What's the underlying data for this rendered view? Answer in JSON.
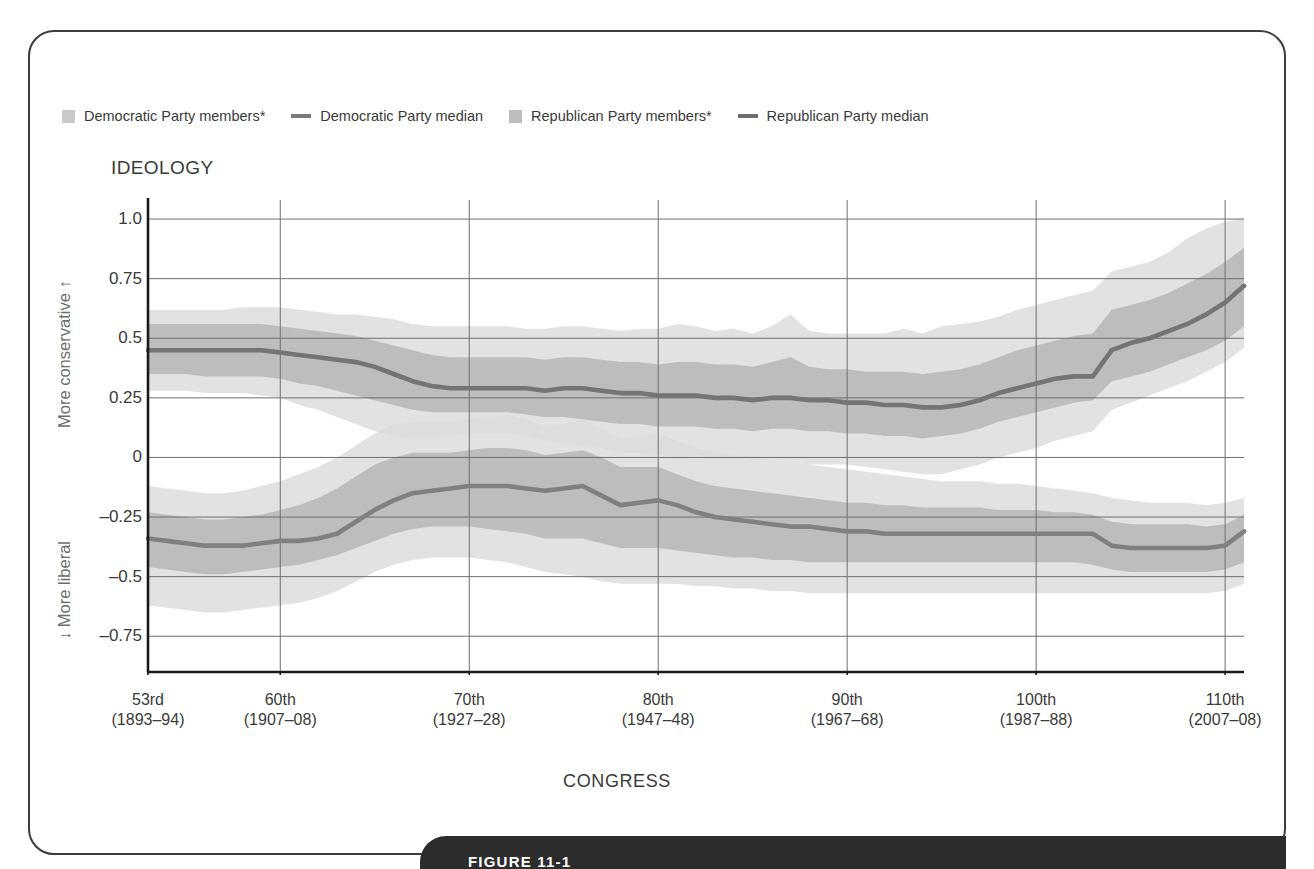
{
  "figure": {
    "caption": "FIGURE 11-1",
    "ideology_title": "IDEOLOGY",
    "congress_title": "CONGRESS",
    "direction_up": "More conservative ↑",
    "direction_down": "↓ More liberal"
  },
  "legend": {
    "items": [
      {
        "label": "Democratic Party members*",
        "marker": "box",
        "color": "#c9c9c9",
        "name": "legend-dem-members"
      },
      {
        "label": "Democratic Party median",
        "marker": "line",
        "color": "#7a7a7a",
        "name": "legend-dem-median"
      },
      {
        "label": "Republican Party members*",
        "marker": "box",
        "color": "#bdbdbd",
        "name": "legend-rep-members"
      },
      {
        "label": "Republican Party median",
        "marker": "line",
        "color": "#6e6e6e",
        "name": "legend-rep-median"
      }
    ]
  },
  "colors": {
    "band_outer": "#dcdcdc",
    "band_mid": "#c6c6c6",
    "band_inner": "#b4b4b4",
    "median_dem": "#808080",
    "median_rep": "#747474",
    "grid": "#6f6f6f",
    "axis": "#1a1a1a",
    "caption_bar": "#2c2c2c",
    "frame": "#3c3c3c"
  },
  "chart_data": {
    "type": "line",
    "title": "IDEOLOGY",
    "xlabel": "CONGRESS",
    "ylabel": "Ideology (DW-NOMINATE first dimension)",
    "grid": true,
    "legend_position": "top-left",
    "ylim": [
      -0.9,
      1.08
    ],
    "xlim": [
      53,
      111
    ],
    "yticks": [
      1.0,
      0.75,
      0.5,
      0.25,
      0,
      -0.25,
      -0.5,
      -0.75
    ],
    "ytick_labels": [
      "1.0",
      "0.75",
      "0.5",
      "0.25",
      "0",
      "–0.25",
      "–0.5",
      "–0.75"
    ],
    "xticks": [
      53,
      60,
      70,
      80,
      90,
      100,
      110
    ],
    "xtick_labels": [
      {
        "congress": "53rd",
        "years": "(1893–94)"
      },
      {
        "congress": "60th",
        "years": "(1907–08)"
      },
      {
        "congress": "70th",
        "years": "(1927–28)"
      },
      {
        "congress": "80th",
        "years": "(1947–48)"
      },
      {
        "congress": "90th",
        "years": "(1967–68)"
      },
      {
        "congress": "100th",
        "years": "(1987–88)"
      },
      {
        "congress": "110th",
        "years": "(2007–08)"
      }
    ],
    "x": [
      53,
      54,
      55,
      56,
      57,
      58,
      59,
      60,
      61,
      62,
      63,
      64,
      65,
      66,
      67,
      68,
      69,
      70,
      71,
      72,
      73,
      74,
      75,
      76,
      77,
      78,
      79,
      80,
      81,
      82,
      83,
      84,
      85,
      86,
      87,
      88,
      89,
      90,
      91,
      92,
      93,
      94,
      95,
      96,
      97,
      98,
      99,
      100,
      101,
      102,
      103,
      104,
      105,
      106,
      107,
      108,
      109,
      110,
      111
    ],
    "series": [
      {
        "name": "Republican Party median",
        "color": "#747474",
        "values": [
          0.45,
          0.45,
          0.45,
          0.45,
          0.45,
          0.45,
          0.45,
          0.44,
          0.43,
          0.42,
          0.41,
          0.4,
          0.38,
          0.35,
          0.32,
          0.3,
          0.29,
          0.29,
          0.29,
          0.29,
          0.29,
          0.28,
          0.29,
          0.29,
          0.28,
          0.27,
          0.27,
          0.26,
          0.26,
          0.26,
          0.25,
          0.25,
          0.24,
          0.25,
          0.25,
          0.24,
          0.24,
          0.23,
          0.23,
          0.22,
          0.22,
          0.21,
          0.21,
          0.22,
          0.24,
          0.27,
          0.29,
          0.31,
          0.33,
          0.34,
          0.34,
          0.45,
          0.48,
          0.5,
          0.53,
          0.56,
          0.6,
          0.65,
          0.72
        ]
      },
      {
        "name": "Democratic Party median",
        "color": "#808080",
        "values": [
          -0.34,
          -0.35,
          -0.36,
          -0.37,
          -0.37,
          -0.37,
          -0.36,
          -0.35,
          -0.35,
          -0.34,
          -0.32,
          -0.27,
          -0.22,
          -0.18,
          -0.15,
          -0.14,
          -0.13,
          -0.12,
          -0.12,
          -0.12,
          -0.13,
          -0.14,
          -0.13,
          -0.12,
          -0.16,
          -0.2,
          -0.19,
          -0.18,
          -0.2,
          -0.23,
          -0.25,
          -0.26,
          -0.27,
          -0.28,
          -0.29,
          -0.29,
          -0.3,
          -0.31,
          -0.31,
          -0.32,
          -0.32,
          -0.32,
          -0.32,
          -0.32,
          -0.32,
          -0.32,
          -0.32,
          -0.32,
          -0.32,
          -0.32,
          -0.32,
          -0.37,
          -0.38,
          -0.38,
          -0.38,
          -0.38,
          -0.38,
          -0.37,
          -0.31
        ]
      }
    ],
    "bands": [
      {
        "name": "Republican Party members* (outer range)",
        "color": "#dcdcdc",
        "upper": [
          0.62,
          0.62,
          0.62,
          0.62,
          0.62,
          0.63,
          0.63,
          0.63,
          0.62,
          0.61,
          0.6,
          0.6,
          0.59,
          0.58,
          0.56,
          0.55,
          0.55,
          0.55,
          0.55,
          0.55,
          0.54,
          0.54,
          0.55,
          0.55,
          0.54,
          0.53,
          0.54,
          0.54,
          0.56,
          0.55,
          0.53,
          0.54,
          0.52,
          0.55,
          0.6,
          0.53,
          0.52,
          0.52,
          0.52,
          0.52,
          0.54,
          0.52,
          0.55,
          0.56,
          0.57,
          0.59,
          0.62,
          0.64,
          0.66,
          0.68,
          0.7,
          0.78,
          0.8,
          0.82,
          0.86,
          0.92,
          0.96,
          0.99,
          1.0
        ],
        "lower": [
          0.28,
          0.28,
          0.28,
          0.27,
          0.27,
          0.27,
          0.26,
          0.25,
          0.22,
          0.2,
          0.17,
          0.14,
          0.11,
          0.09,
          0.08,
          0.08,
          0.09,
          0.1,
          0.1,
          0.1,
          0.09,
          0.07,
          0.06,
          0.05,
          0.04,
          0.02,
          0.02,
          0.01,
          0.0,
          0.01,
          0.0,
          0.0,
          -0.01,
          -0.01,
          -0.02,
          -0.03,
          -0.03,
          -0.03,
          -0.04,
          -0.05,
          -0.06,
          -0.07,
          -0.07,
          -0.05,
          -0.03,
          0.0,
          0.02,
          0.04,
          0.07,
          0.09,
          0.11,
          0.2,
          0.23,
          0.26,
          0.29,
          0.32,
          0.36,
          0.4,
          0.46
        ]
      },
      {
        "name": "Republican Party members* (inner range)",
        "color": "#b4b4b4",
        "upper": [
          0.56,
          0.56,
          0.56,
          0.56,
          0.56,
          0.56,
          0.56,
          0.55,
          0.54,
          0.53,
          0.52,
          0.51,
          0.49,
          0.47,
          0.45,
          0.43,
          0.42,
          0.42,
          0.42,
          0.42,
          0.42,
          0.41,
          0.42,
          0.42,
          0.41,
          0.4,
          0.4,
          0.39,
          0.4,
          0.4,
          0.39,
          0.39,
          0.38,
          0.4,
          0.42,
          0.38,
          0.37,
          0.37,
          0.36,
          0.36,
          0.36,
          0.35,
          0.36,
          0.37,
          0.39,
          0.42,
          0.45,
          0.47,
          0.49,
          0.51,
          0.52,
          0.62,
          0.64,
          0.66,
          0.69,
          0.73,
          0.77,
          0.82,
          0.88
        ],
        "lower": [
          0.35,
          0.35,
          0.35,
          0.34,
          0.34,
          0.34,
          0.34,
          0.33,
          0.31,
          0.3,
          0.28,
          0.26,
          0.24,
          0.22,
          0.2,
          0.19,
          0.19,
          0.19,
          0.19,
          0.19,
          0.18,
          0.17,
          0.17,
          0.16,
          0.15,
          0.14,
          0.14,
          0.13,
          0.13,
          0.13,
          0.12,
          0.12,
          0.11,
          0.12,
          0.12,
          0.11,
          0.11,
          0.1,
          0.1,
          0.09,
          0.09,
          0.08,
          0.09,
          0.1,
          0.12,
          0.15,
          0.17,
          0.19,
          0.21,
          0.23,
          0.24,
          0.32,
          0.34,
          0.36,
          0.39,
          0.42,
          0.45,
          0.49,
          0.55
        ]
      },
      {
        "name": "Democratic Party members* (outer range)",
        "color": "#dcdcdc",
        "upper": [
          -0.12,
          -0.13,
          -0.14,
          -0.15,
          -0.15,
          -0.14,
          -0.12,
          -0.1,
          -0.07,
          -0.04,
          0.0,
          0.05,
          0.1,
          0.14,
          0.15,
          0.15,
          0.15,
          0.16,
          0.17,
          0.18,
          0.16,
          0.13,
          0.14,
          0.16,
          0.12,
          0.08,
          0.09,
          0.1,
          0.07,
          0.04,
          0.02,
          0.01,
          0.0,
          -0.01,
          -0.02,
          -0.03,
          -0.04,
          -0.05,
          -0.06,
          -0.07,
          -0.08,
          -0.09,
          -0.1,
          -0.1,
          -0.1,
          -0.11,
          -0.11,
          -0.12,
          -0.13,
          -0.14,
          -0.15,
          -0.17,
          -0.18,
          -0.19,
          -0.19,
          -0.19,
          -0.2,
          -0.19,
          -0.17
        ],
        "lower": [
          -0.62,
          -0.63,
          -0.64,
          -0.65,
          -0.65,
          -0.64,
          -0.63,
          -0.62,
          -0.61,
          -0.59,
          -0.56,
          -0.52,
          -0.48,
          -0.45,
          -0.43,
          -0.42,
          -0.42,
          -0.42,
          -0.43,
          -0.44,
          -0.46,
          -0.48,
          -0.49,
          -0.5,
          -0.52,
          -0.53,
          -0.53,
          -0.53,
          -0.53,
          -0.54,
          -0.54,
          -0.55,
          -0.55,
          -0.56,
          -0.56,
          -0.57,
          -0.57,
          -0.57,
          -0.57,
          -0.57,
          -0.57,
          -0.57,
          -0.57,
          -0.57,
          -0.57,
          -0.57,
          -0.57,
          -0.57,
          -0.57,
          -0.57,
          -0.57,
          -0.57,
          -0.57,
          -0.57,
          -0.57,
          -0.57,
          -0.57,
          -0.56,
          -0.53
        ]
      },
      {
        "name": "Democratic Party members* (inner range)",
        "color": "#b4b4b4",
        "upper": [
          -0.23,
          -0.24,
          -0.25,
          -0.26,
          -0.26,
          -0.25,
          -0.24,
          -0.22,
          -0.2,
          -0.17,
          -0.13,
          -0.08,
          -0.03,
          0.0,
          0.02,
          0.02,
          0.02,
          0.03,
          0.04,
          0.04,
          0.03,
          0.01,
          0.02,
          0.03,
          0.0,
          -0.04,
          -0.04,
          -0.04,
          -0.07,
          -0.1,
          -0.12,
          -0.13,
          -0.14,
          -0.15,
          -0.16,
          -0.17,
          -0.18,
          -0.19,
          -0.19,
          -0.2,
          -0.2,
          -0.21,
          -0.21,
          -0.21,
          -0.21,
          -0.22,
          -0.22,
          -0.22,
          -0.23,
          -0.23,
          -0.24,
          -0.27,
          -0.28,
          -0.28,
          -0.28,
          -0.28,
          -0.29,
          -0.28,
          -0.24
        ],
        "lower": [
          -0.46,
          -0.47,
          -0.48,
          -0.49,
          -0.49,
          -0.48,
          -0.47,
          -0.46,
          -0.45,
          -0.43,
          -0.41,
          -0.38,
          -0.35,
          -0.32,
          -0.3,
          -0.29,
          -0.29,
          -0.29,
          -0.3,
          -0.31,
          -0.32,
          -0.34,
          -0.34,
          -0.34,
          -0.36,
          -0.38,
          -0.38,
          -0.38,
          -0.39,
          -0.4,
          -0.41,
          -0.42,
          -0.42,
          -0.43,
          -0.43,
          -0.44,
          -0.44,
          -0.44,
          -0.44,
          -0.44,
          -0.44,
          -0.44,
          -0.44,
          -0.44,
          -0.44,
          -0.44,
          -0.44,
          -0.44,
          -0.44,
          -0.44,
          -0.45,
          -0.47,
          -0.48,
          -0.48,
          -0.48,
          -0.48,
          -0.48,
          -0.47,
          -0.44
        ]
      }
    ]
  }
}
